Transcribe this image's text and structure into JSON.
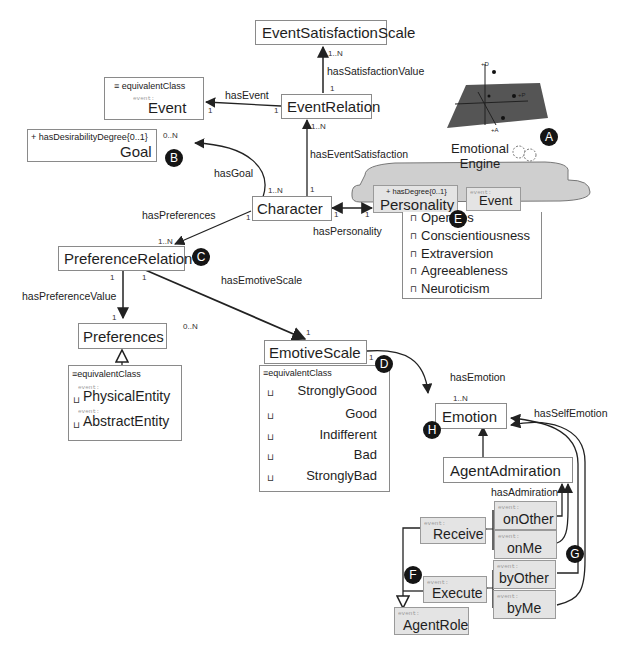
{
  "diagram": {
    "nodes": {
      "event_satisfaction_scale": {
        "title": "EventSatisfactionScale"
      },
      "event_relation": {
        "title": "EventRelation"
      },
      "event": {
        "title": "Event",
        "stereotype": "event:",
        "equivalent_class": "equivalentClass"
      },
      "goal": {
        "title": "Goal",
        "attribute": "+ hasDesirabilityDegree{0..1}"
      },
      "character": {
        "title": "Character"
      },
      "personality": {
        "title": "Personality",
        "attribute": "+ hasDegree{0..1}"
      },
      "personality_event": {
        "title": "Event",
        "stereotype": "event:"
      },
      "preference_relation": {
        "title": "PreferenceRelation"
      },
      "preferences": {
        "title": "Preferences"
      },
      "preferences_equiv": {
        "equivalent_class": "equivalentClass",
        "items": [
          {
            "stereotype": "event:",
            "label": "PhysicalEntity",
            "symbol": "⊔"
          },
          {
            "stereotype": "event:",
            "label": "AbstractEntity",
            "symbol": "⊔"
          }
        ]
      },
      "emotive_scale": {
        "title": "EmotiveScale"
      },
      "emotive_scale_equiv": {
        "equivalent_class": "equivalentClass",
        "items": [
          {
            "label": "StronglyGood",
            "symbol": "⊔"
          },
          {
            "label": "Good",
            "symbol": "⊔"
          },
          {
            "label": "Indifferent",
            "symbol": "⊔"
          },
          {
            "label": "Bad",
            "symbol": "⊔"
          },
          {
            "label": "StronglyBad",
            "symbol": "⊔"
          }
        ]
      },
      "personality_traits": {
        "items": [
          {
            "label": "Opennes",
            "symbol": "⊓"
          },
          {
            "label": "Conscientiousness",
            "symbol": "⊓"
          },
          {
            "label": "Extraversion",
            "symbol": "⊓"
          },
          {
            "label": "Agreeableness",
            "symbol": "⊓"
          },
          {
            "label": "Neuroticism",
            "symbol": "⊓"
          }
        ]
      },
      "emotion": {
        "title": "Emotion"
      },
      "agent_admiration": {
        "title": "AgentAdmiration"
      },
      "on_other": {
        "title": "onOther",
        "stereotype": "event:"
      },
      "on_me": {
        "title": "onMe",
        "stereotype": "event:"
      },
      "by_other": {
        "title": "byOther",
        "stereotype": "event:"
      },
      "by_me": {
        "title": "byMe",
        "stereotype": "event:"
      },
      "receive": {
        "title": "Receive",
        "stereotype": "event:"
      },
      "execute": {
        "title": "Execute",
        "stereotype": "event:"
      },
      "agent_role": {
        "title": "AgentRole",
        "stereotype": "event:"
      },
      "emotional_engine": {
        "line1": "Emotional",
        "line2": "Engine",
        "axis_labels": [
          "+D",
          "+P",
          "+A"
        ]
      }
    },
    "edges": {
      "has_satisfaction_value": {
        "label": "hasSatisfactionValue",
        "from_mult": "1",
        "to_mult": "1..N"
      },
      "has_event": {
        "label": "hasEvent",
        "from_mult": "1",
        "to_mult": "1"
      },
      "has_event_satisfaction": {
        "label": "hasEventSatisfaction",
        "from_mult": "1",
        "to_mult": "1..N"
      },
      "has_goal": {
        "label": "hasGoal",
        "from_mult": "1..N",
        "to_mult": "0..N"
      },
      "has_preferences": {
        "label": "hasPreferences",
        "from_mult": "1",
        "to_mult": "1..N"
      },
      "has_personality": {
        "label": "hasPersonality",
        "from_mult": "1",
        "to_mult": "1"
      },
      "has_preference_value": {
        "label": "hasPreferenceValue",
        "from_mult": "1",
        "to_mult": "1"
      },
      "has_emotive_scale": {
        "label": "hasEmotiveScale",
        "from_mult": "1",
        "to_mult": "1",
        "extra_mult": "0..N"
      },
      "has_emotion": {
        "label": "hasEmotion",
        "from_mult": "1",
        "to_mult": "1..N"
      },
      "has_self_emotion": {
        "label": "hasSelfEmotion"
      },
      "has_admiration": {
        "label": "hasAdmiration"
      }
    },
    "badges": [
      "A",
      "B",
      "C",
      "D",
      "E",
      "F",
      "G",
      "H"
    ]
  }
}
